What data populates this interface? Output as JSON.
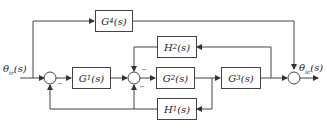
{
  "diagram": {
    "input_label": "θir(s)",
    "input_main": "θ",
    "input_sub": "ir",
    "input_tail": "(s)",
    "output_main": "θ",
    "output_sub": "ic",
    "output_tail": "(s)",
    "blocks": {
      "G1": {
        "main": "G",
        "sub": "1",
        "tail": "(s)"
      },
      "G2": {
        "main": "G",
        "sub": "2",
        "tail": "(s)"
      },
      "G3": {
        "main": "G",
        "sub": "3",
        "tail": "(s)"
      },
      "G4": {
        "main": "G",
        "sub": "4",
        "tail": "(s)"
      },
      "H1": {
        "main": "H",
        "sub": "1",
        "tail": "(s)"
      },
      "H2": {
        "main": "H",
        "sub": "2",
        "tail": "(s)"
      }
    },
    "signs": {
      "sum1_bottom": "−",
      "sum2_top": "−",
      "sum2_bottom": "−"
    }
  }
}
